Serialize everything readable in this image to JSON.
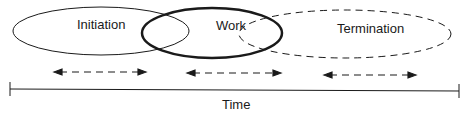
{
  "phases": [
    {
      "label": "Initiation",
      "style": "thin-solid"
    },
    {
      "label": "Work",
      "style": "bold-solid"
    },
    {
      "label": "Termination",
      "style": "dashed"
    }
  ],
  "axis": {
    "label": "Time"
  },
  "colors": {
    "stroke": "#1a1a1a",
    "background": "#ffffff"
  }
}
